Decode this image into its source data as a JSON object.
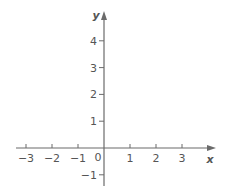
{
  "chart_data": {
    "type": "scatter",
    "title": "",
    "xlabel": "x",
    "ylabel": "y",
    "xlim": [
      -3,
      3
    ],
    "ylim": [
      -1,
      4
    ],
    "x_ticks": [
      -3,
      -2,
      -1,
      1,
      2,
      3
    ],
    "x_tick_labels": [
      "−3",
      "−2",
      "−1",
      "1",
      "2",
      "3"
    ],
    "y_ticks": [
      4,
      3,
      2,
      1,
      -1
    ],
    "y_tick_labels": [
      "4",
      "3",
      "2",
      "1",
      "−1"
    ],
    "origin_label": "0",
    "grid": false,
    "series": [],
    "colors": {
      "axis": "#6b6b6b",
      "text": "#555555"
    }
  },
  "axes": {
    "x_label": "x",
    "y_label": "y",
    "origin_label": "0"
  }
}
